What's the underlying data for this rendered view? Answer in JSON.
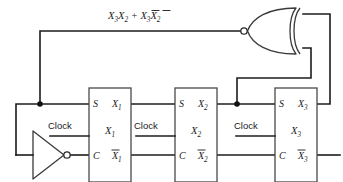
{
  "diagram": {
    "title_expression": "X3X2 + X̄3X̄2",
    "expression_parts": {
      "term1_a": "X",
      "term1_a_sub": "3",
      "term1_b": "X",
      "term1_b_sub": "2",
      "plus": "+",
      "term2_a": "X",
      "term2_a_sub": "3",
      "term2_b": "X",
      "term2_b_sub": "2"
    },
    "colors": {
      "wire": "#1c1c1c",
      "box_stroke": "#4a4a4a",
      "gate_stroke": "#3a3a3a",
      "background": "#ffffff",
      "text": "#1a1a1a"
    }
  },
  "flipflops": [
    {
      "id": "ff1",
      "set_label": "S",
      "clear_label": "C",
      "q_label": "X",
      "q_sub": "1",
      "qbar_label": "X",
      "qbar_sub": "1",
      "center_label": "X",
      "center_sub": "1",
      "clock_label": "Clock"
    },
    {
      "id": "ff2",
      "set_label": "S",
      "clear_label": "C",
      "q_label": "X",
      "q_sub": "2",
      "qbar_label": "X",
      "qbar_sub": "2",
      "center_label": "X",
      "center_sub": "2",
      "clock_label": "Clock"
    },
    {
      "id": "ff3",
      "set_label": "S",
      "clear_label": "C",
      "q_label": "X",
      "q_sub": "3",
      "qbar_label": "X",
      "qbar_sub": "3",
      "center_label": "X",
      "center_sub": "3",
      "clock_label": "Clock"
    }
  ],
  "gates": [
    {
      "id": "xnor1",
      "type": "xnor",
      "orientation": "mirrored-left-output",
      "inputs": 2,
      "has_output_bubble": true
    },
    {
      "id": "inverter1",
      "type": "not",
      "orientation": "right",
      "inputs": 1,
      "has_output_bubble": true
    }
  ],
  "junctions": [
    {
      "id": "j-left-feedback",
      "x": 40,
      "y": 104
    },
    {
      "id": "j-x2-tap",
      "x": 237,
      "y": 104
    }
  ]
}
